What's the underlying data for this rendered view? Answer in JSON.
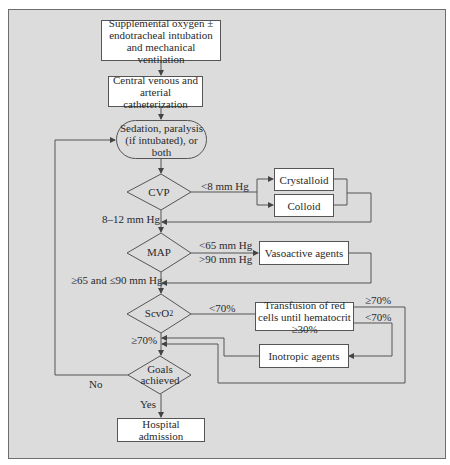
{
  "diagram": {
    "colors": {
      "background": "#dcdcdc",
      "box_fill": "#ffffff",
      "line": "#555555",
      "text": "#2a2a2a"
    },
    "nodes": {
      "oxygen": "Supplemental oxygen ± endotracheal intubation and mechanical ventilation",
      "catheter": "Central venous and arterial catheterization",
      "sedation": "Sedation, paralysis (if intubated), or both",
      "cvp": "CVP",
      "crystalloid": "Crystalloid",
      "colloid": "Colloid",
      "map": "MAP",
      "vasoactive": "Vasoactive agents",
      "scvo2_main": "ScvO",
      "scvo2_sub": "2",
      "transfusion": "Transfusion of red cells until hematocrit ≥30%",
      "inotropic": "Inotropic agents",
      "goals": "Goals achieved",
      "hospital": "Hospital admission"
    },
    "edge_labels": {
      "cvp_low": "<8 mm Hg",
      "cvp_ok": "8–12 mm Hg",
      "map_low": "<65 mm Hg",
      "map_high": ">90 mm Hg",
      "map_ok": "≥65 and ≤90 mm Hg",
      "scvo2_low": "<70%",
      "scvo2_ok": "≥70%",
      "transfusion_ok": "≥70%",
      "transfusion_low": "<70%",
      "goals_no": "No",
      "goals_yes": "Yes"
    }
  }
}
